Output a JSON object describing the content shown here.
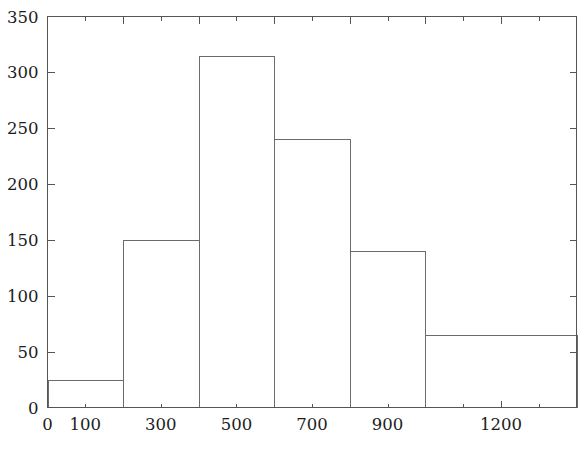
{
  "chart_data": {
    "type": "bar",
    "title": "",
    "subtitle": "",
    "xlabel": "",
    "ylabel": "",
    "xlim": [
      0,
      1400
    ],
    "ylim": [
      0,
      350
    ],
    "grid": false,
    "legend": null,
    "bin_edges": [
      0,
      200,
      400,
      600,
      800,
      1000,
      1400
    ],
    "categories": [
      "0-200",
      "200-400",
      "400-600",
      "600-800",
      "800-1000",
      "1000-1400"
    ],
    "values": [
      25,
      150,
      315,
      240,
      140,
      65
    ],
    "bars": [
      {
        "x0": 0,
        "x1": 200,
        "height": 25
      },
      {
        "x0": 200,
        "x1": 400,
        "height": 150
      },
      {
        "x0": 400,
        "x1": 600,
        "height": 315
      },
      {
        "x0": 600,
        "x1": 800,
        "height": 240
      },
      {
        "x0": 800,
        "x1": 1000,
        "height": 140
      },
      {
        "x0": 1000,
        "x1": 1400,
        "height": 65
      }
    ],
    "x_ticks": [
      0,
      100,
      200,
      300,
      400,
      500,
      600,
      700,
      800,
      900,
      1000,
      1100,
      1200,
      1300,
      1400
    ],
    "x_major_ticks": [
      0,
      200,
      400,
      600,
      800,
      1000,
      1200,
      1400
    ],
    "x_tick_labels": [
      {
        "value": 0,
        "label": "0"
      },
      {
        "value": 100,
        "label": "100"
      },
      {
        "value": 300,
        "label": "300"
      },
      {
        "value": 500,
        "label": "500"
      },
      {
        "value": 700,
        "label": "700"
      },
      {
        "value": 900,
        "label": "900"
      },
      {
        "value": 1200,
        "label": "1200"
      }
    ],
    "y_ticks": [
      0,
      50,
      100,
      150,
      200,
      250,
      300,
      350
    ],
    "y_tick_labels": [
      {
        "value": 0,
        "label": "0"
      },
      {
        "value": 50,
        "label": "50"
      },
      {
        "value": 100,
        "label": "100"
      },
      {
        "value": 150,
        "label": "150"
      },
      {
        "value": 200,
        "label": "200"
      },
      {
        "value": 250,
        "label": "250"
      },
      {
        "value": 300,
        "label": "300"
      },
      {
        "value": 350,
        "label": "350"
      }
    ],
    "colors": {
      "background": "#ffffff",
      "axis": "#555555",
      "bar_stroke": "#6b6b6b",
      "bar_fill": "none",
      "text": "#1c1c1c"
    }
  }
}
